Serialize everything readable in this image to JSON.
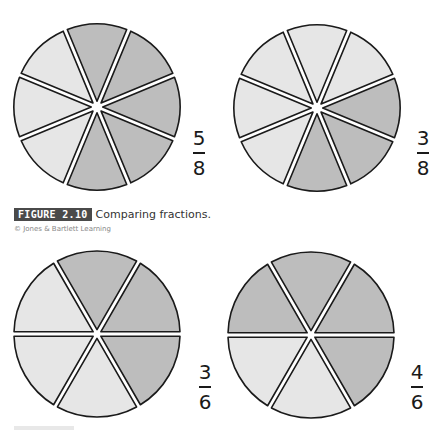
{
  "figure": {
    "label": "FIGURE 2.10",
    "title": "Comparing fractions.",
    "credit": "© Jones & Bartlett Learning"
  },
  "colors": {
    "shaded": "#bdbdbd",
    "unshaded": "#e6e6e6",
    "outline": "#1a1a1a",
    "gap": "#ffffff"
  },
  "chart_data": [
    {
      "type": "pie",
      "title": "5/8",
      "numerator": 5,
      "denominator": 8,
      "sectors": 8,
      "shaded_sectors_clockwise_from_top": [
        0,
        1,
        2,
        3,
        4
      ],
      "center": [
        97,
        107
      ],
      "radius": 83,
      "start_angle_deg": -112.5
    },
    {
      "type": "pie",
      "title": "3/8",
      "numerator": 3,
      "denominator": 8,
      "sectors": 8,
      "shaded_sectors_clockwise_from_top": [
        2,
        3,
        4
      ],
      "center": [
        317,
        108
      ],
      "radius": 83,
      "start_angle_deg": -112.5
    },
    {
      "type": "pie",
      "title": "3/6",
      "numerator": 3,
      "denominator": 6,
      "sectors": 6,
      "shaded_sectors_clockwise_from_top": [
        0,
        1,
        2
      ],
      "center": [
        97,
        334
      ],
      "radius": 83,
      "start_angle_deg": -120
    },
    {
      "type": "pie",
      "title": "4/6",
      "numerator": 4,
      "denominator": 6,
      "sectors": 6,
      "shaded_sectors_clockwise_from_top": [
        0,
        1,
        2,
        5
      ],
      "center": [
        311,
        335
      ],
      "radius": 83,
      "start_angle_deg": -120
    }
  ],
  "fractions": [
    {
      "num": "5",
      "den": "8"
    },
    {
      "num": "3",
      "den": "8"
    },
    {
      "num": "3",
      "den": "6"
    },
    {
      "num": "4",
      "den": "6"
    }
  ]
}
